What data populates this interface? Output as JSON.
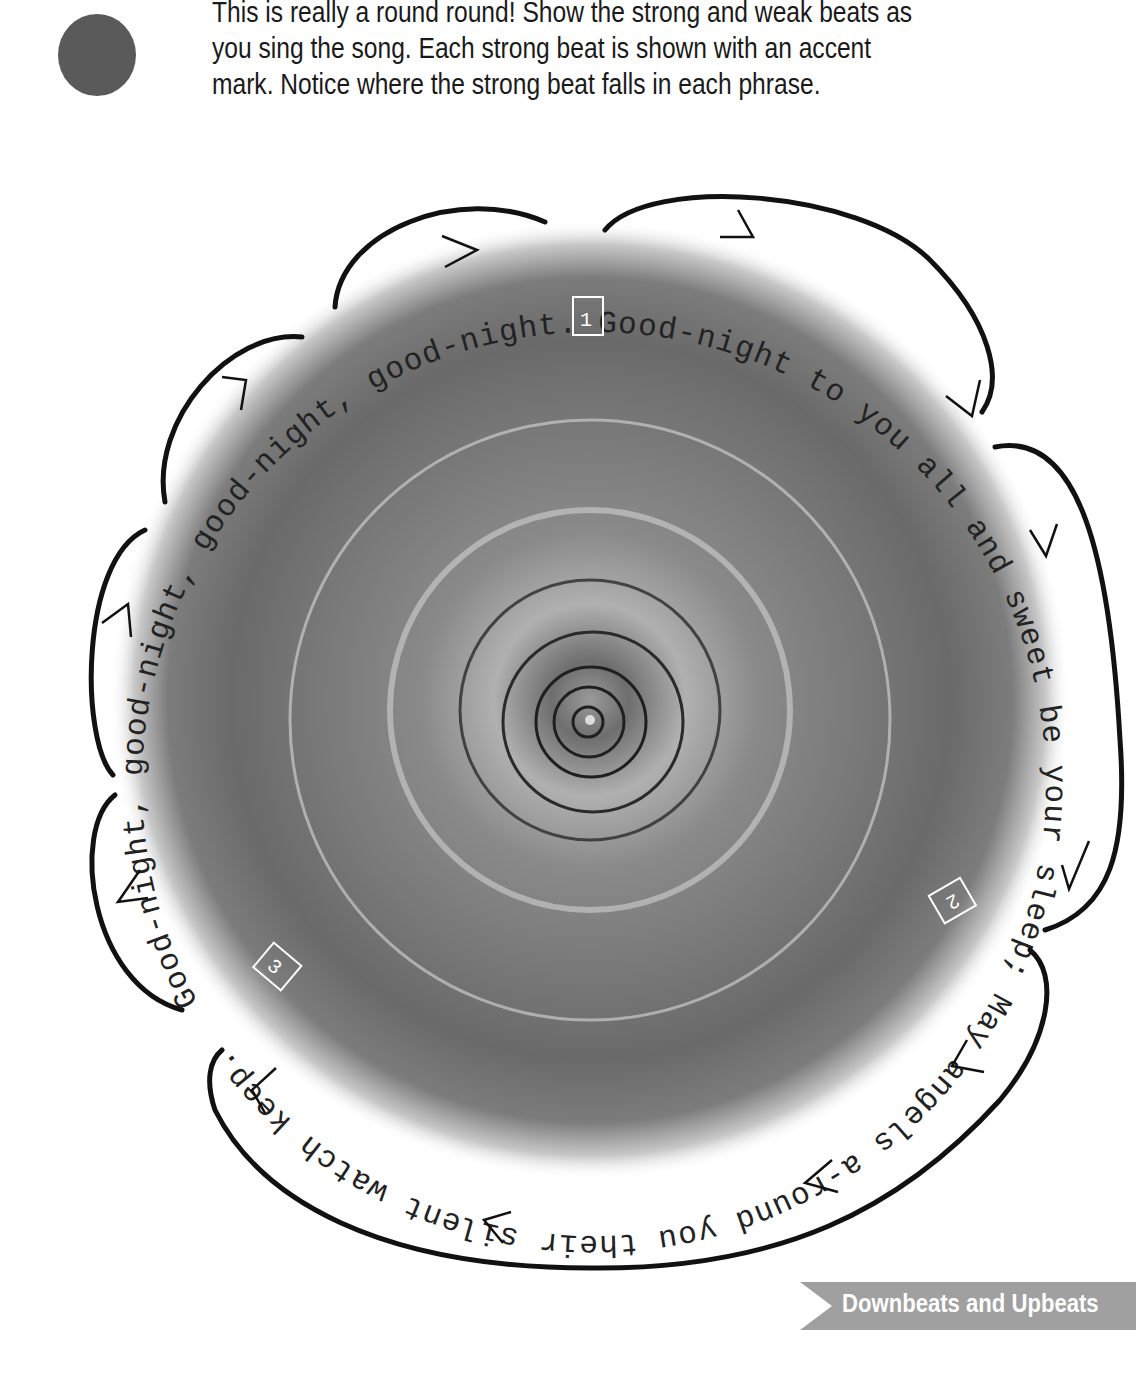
{
  "intro": {
    "bullet_color": "#5a5a5a",
    "lines": [
      "This is really a round round! Show the strong and weak beats as",
      "you sing the song. Each strong beat is shown with an accent",
      "mark. Notice where the strong beat falls in each phrase."
    ]
  },
  "round": {
    "lyrics": "Good-night, good-night, good-night, good-night. Good-night to you all and sweet be your sleep; May angels a-round you their silent watch keep.",
    "entry_markers": [
      "1",
      "2",
      "3"
    ],
    "accent_mark": ">",
    "accent_count": 12,
    "phrase_brackets": 8
  },
  "footer": {
    "section_title": "Downbeats and Upbeats",
    "banner_color": "#a0a0a0"
  }
}
